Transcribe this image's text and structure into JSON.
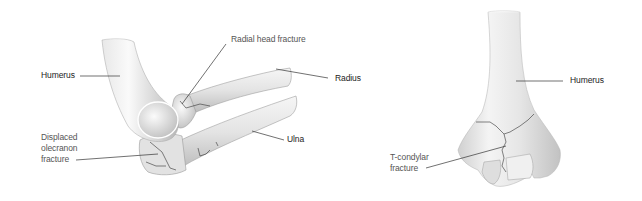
{
  "diagram": {
    "left_figure": {
      "description": "Lateral view of elbow showing radial head and olecranon fractures",
      "labels": {
        "humerus": "Humerus",
        "radial_head_fracture": "Radial head fracture",
        "radius": "Radius",
        "ulna": "Ulna",
        "olecranon_line1": "Displaced",
        "olecranon_line2": "olecranon",
        "olecranon_line3": "fracture"
      }
    },
    "right_figure": {
      "description": "Anterior view of distal humerus showing T-condylar fracture",
      "labels": {
        "humerus": "Humerus",
        "tcondylar_line1": "T-condylar",
        "tcondylar_line2": "fracture"
      }
    },
    "colors": {
      "bone_light": "#f2f2f2",
      "bone_shade": "#b8b8b8",
      "bone_outline": "#8a8a8a",
      "fracture_line": "#333333",
      "leader_line": "#333333",
      "text": "#222222"
    }
  }
}
